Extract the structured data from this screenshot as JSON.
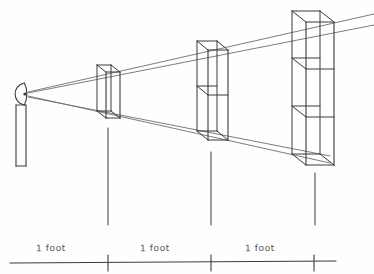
{
  "figure": {
    "background_color": "#fefefe",
    "ink_color": "#3a3a3a",
    "light_ink_color": "#6e6e6e",
    "width": 374,
    "height": 274
  },
  "observer": {
    "name": "eye-on-stand",
    "eye_center_x": 20,
    "eye_center_y": 94,
    "eye_rx": 8,
    "eye_ry": 11,
    "pupil_x": 25,
    "pupil_y": 94,
    "post_left": 16,
    "post_right": 26,
    "post_top": 105,
    "post_bottom": 166
  },
  "sight_lines": [
    {
      "name": "upper-sight-line-outer",
      "x1": 28,
      "y1": 92,
      "x2": 374,
      "y2": 14
    },
    {
      "name": "upper-sight-line-inner",
      "x1": 28,
      "y1": 93,
      "x2": 374,
      "y2": 25
    },
    {
      "name": "lower-sight-line-outer",
      "x1": 28,
      "y1": 96,
      "x2": 330,
      "y2": 163
    },
    {
      "name": "lower-sight-line-inner",
      "x1": 28,
      "y1": 97,
      "x2": 330,
      "y2": 156
    }
  ],
  "panels": [
    {
      "name": "panel-near",
      "order": 1,
      "front_left_x": 106,
      "front_right_x": 120,
      "front_top_y": 72,
      "front_bottom_y": 118,
      "back_offset_x": -9,
      "back_offset_y": -7,
      "divisions": 1,
      "division_ys": []
    },
    {
      "name": "panel-middle",
      "order": 2,
      "front_left_x": 208,
      "front_right_x": 228,
      "front_top_y": 50,
      "front_bottom_y": 140,
      "back_offset_x": -11,
      "back_offset_y": -9,
      "divisions": 2,
      "division_ys": [
        95
      ]
    },
    {
      "name": "panel-far",
      "order": 3,
      "front_left_x": 306,
      "front_right_x": 334,
      "front_top_y": 22,
      "front_bottom_y": 165,
      "back_offset_x": -14,
      "back_offset_y": -11,
      "divisions": 3,
      "division_ys": [
        69,
        117
      ]
    }
  ],
  "drop_lines": [
    {
      "name": "drop-line-1",
      "x": 108,
      "y1": 128,
      "y2": 225
    },
    {
      "name": "drop-line-2",
      "x": 211,
      "y1": 152,
      "y2": 225
    },
    {
      "name": "drop-line-3",
      "x": 315,
      "y1": 173,
      "y2": 225
    }
  ],
  "ruler": {
    "name": "one-foot-ruler",
    "x_start": 10,
    "x_end": 336,
    "y": 263,
    "ticks": [
      {
        "name": "ruler-tick-1",
        "x": 108,
        "y_top": 255,
        "y_bottom": 271
      },
      {
        "name": "ruler-tick-2",
        "x": 211,
        "y_top": 255,
        "y_bottom": 271
      },
      {
        "name": "ruler-tick-3",
        "x": 314,
        "y_top": 255,
        "y_bottom": 271
      }
    ],
    "segments": [
      {
        "name": "ruler-segment-1",
        "label": "1 foot"
      },
      {
        "name": "ruler-segment-2",
        "label": "1 foot"
      },
      {
        "name": "ruler-segment-3",
        "label": "1 foot"
      }
    ]
  }
}
